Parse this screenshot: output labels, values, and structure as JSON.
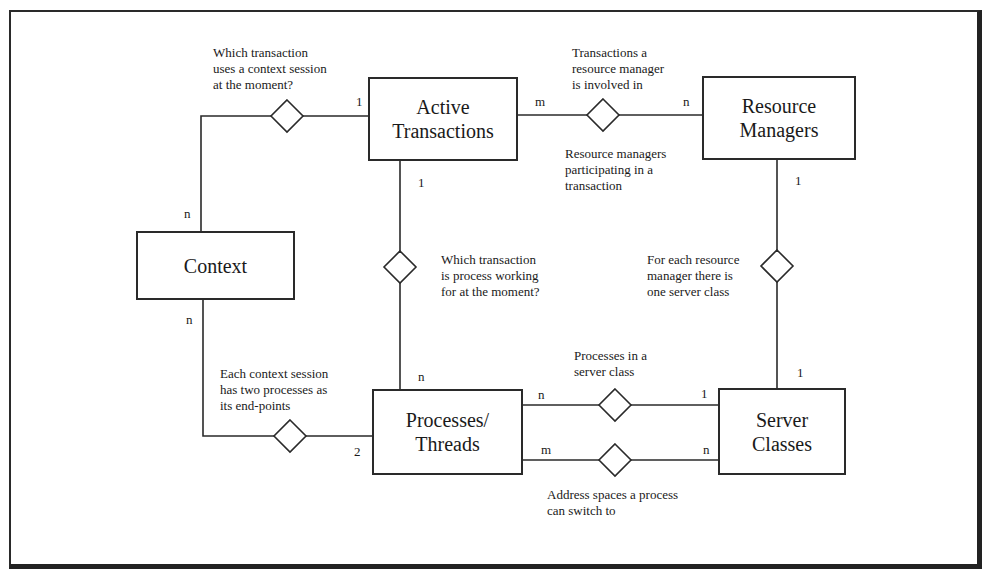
{
  "diagram": {
    "type": "entity-relationship",
    "entities": [
      {
        "id": "active_transactions",
        "line1": "Active",
        "line2": "Transactions"
      },
      {
        "id": "resource_managers",
        "line1": "Resource",
        "line2": "Managers"
      },
      {
        "id": "context",
        "line1": "Context",
        "line2": ""
      },
      {
        "id": "processes_threads",
        "line1": "Processes/",
        "line2": "Threads"
      },
      {
        "id": "server_classes",
        "line1": "Server",
        "line2": "Classes"
      }
    ],
    "relationships": [
      {
        "id": "context_transaction",
        "between": [
          "context",
          "active_transactions"
        ],
        "cardinality": {
          "context": "n",
          "active_transactions": "1"
        },
        "notes": [
          "Which transaction",
          "uses a context session",
          "at the moment?"
        ]
      },
      {
        "id": "transaction_resource_manager",
        "between": [
          "active_transactions",
          "resource_managers"
        ],
        "cardinality": {
          "active_transactions": "m",
          "resource_managers": "n"
        },
        "notes_above": [
          "Transactions a",
          "resource manager",
          "is involved in"
        ],
        "notes_below": [
          "Resource managers",
          "participating in a",
          "transaction"
        ]
      },
      {
        "id": "process_transaction",
        "between": [
          "active_transactions",
          "processes_threads"
        ],
        "cardinality": {
          "active_transactions": "1",
          "processes_threads": "n"
        },
        "notes": [
          "Which transaction",
          "is process working",
          "for at the moment?"
        ]
      },
      {
        "id": "resource_manager_server_class",
        "between": [
          "resource_managers",
          "server_classes"
        ],
        "cardinality": {
          "resource_managers": "1",
          "server_classes": "1"
        },
        "notes": [
          "For each resource",
          "manager there is",
          "one server class"
        ]
      },
      {
        "id": "context_processes",
        "between": [
          "context",
          "processes_threads"
        ],
        "cardinality": {
          "context": "n",
          "processes_threads": "2"
        },
        "notes": [
          "Each context session",
          "has two processes as",
          "its end-points"
        ]
      },
      {
        "id": "processes_in_server_class",
        "between": [
          "processes_threads",
          "server_classes"
        ],
        "cardinality": {
          "processes_threads": "n",
          "server_classes": "1"
        },
        "notes": [
          "Processes in a",
          "server class"
        ]
      },
      {
        "id": "address_spaces",
        "between": [
          "processes_threads",
          "server_classes"
        ],
        "cardinality": {
          "processes_threads": "m",
          "server_classes": "n"
        },
        "notes": [
          "Address spaces a process",
          "can switch to"
        ]
      }
    ]
  },
  "colors": {
    "line": "#2a2a2a",
    "background": "#ffffff",
    "text": "#1a1a1a"
  }
}
